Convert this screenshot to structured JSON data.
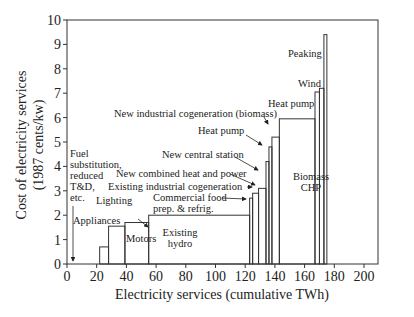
{
  "chart_data": {
    "type": "bar",
    "subtype": "supply-curve-step",
    "title": "",
    "xlabel": "Electricity services (cumulative TWh)",
    "ylabel": [
      "Cost of electricity services",
      "(1987 cents/kw)"
    ],
    "xlim": [
      0,
      210
    ],
    "ylim": [
      0,
      10
    ],
    "xticks": [
      0,
      20,
      40,
      60,
      80,
      100,
      120,
      140,
      160,
      180,
      200
    ],
    "yticks": [
      0,
      1,
      2,
      3,
      4,
      5,
      6,
      7,
      8,
      9,
      10
    ],
    "grid": false,
    "bars": [
      {
        "x0": 22,
        "x1": 28,
        "y": 0.7
      },
      {
        "x0": 28,
        "x1": 39,
        "y": 1.55
      },
      {
        "x0": 39,
        "x1": 55,
        "y": 1.7
      },
      {
        "x0": 55,
        "x1": 123,
        "y": 2.0
      },
      {
        "x0": 123,
        "x1": 125,
        "y": 2.7
      },
      {
        "x0": 125,
        "x1": 129,
        "y": 2.9
      },
      {
        "x0": 129,
        "x1": 134,
        "y": 3.1
      },
      {
        "x0": 134,
        "x1": 136,
        "y": 4.2
      },
      {
        "x0": 136,
        "x1": 138,
        "y": 4.8
      },
      {
        "x0": 138,
        "x1": 143,
        "y": 5.2
      },
      {
        "x0": 143,
        "x1": 167,
        "y": 5.95
      },
      {
        "x0": 167,
        "x1": 170,
        "y": 7.05
      },
      {
        "x0": 170,
        "x1": 173,
        "y": 7.2
      },
      {
        "x0": 173,
        "x1": 175,
        "y": 9.4
      }
    ],
    "annotations": [
      {
        "text": [
          "Fuel",
          "substitution,",
          "reduced",
          "T&D,",
          "etc."
        ],
        "x": 70,
        "y": 157
      },
      {
        "text": [
          "Appliances"
        ],
        "x": 73,
        "y": 224
      },
      {
        "text": [
          "Lighting"
        ],
        "x": 96,
        "y": 204
      },
      {
        "text": [
          "Motors"
        ],
        "x": 126,
        "y": 242
      },
      {
        "text": [
          "Existing",
          "hydro"
        ],
        "x": 180,
        "y": 236
      },
      {
        "text": [
          "Commercial food",
          "prep. & refrig."
        ],
        "x": 153,
        "y": 201
      },
      {
        "text": [
          "Existing industrial cogeneration"
        ],
        "x": 108,
        "y": 190
      },
      {
        "text": [
          "New combined heat and power"
        ],
        "x": 116,
        "y": 177
      },
      {
        "text": [
          "New central station"
        ],
        "x": 162,
        "y": 158
      },
      {
        "text": [
          "Heat pump"
        ],
        "x": 198,
        "y": 134
      },
      {
        "text": [
          "New industrial cogeneration (biomass)"
        ],
        "x": 114,
        "y": 117
      },
      {
        "text": [
          "Heat pump"
        ],
        "x": 268,
        "y": 107
      },
      {
        "text": [
          "Biomass",
          "CHP"
        ],
        "x": 311,
        "y": 180
      },
      {
        "text": [
          "Wind"
        ],
        "x": 298,
        "y": 87
      },
      {
        "text": [
          "Peaking"
        ],
        "x": 288,
        "y": 57
      }
    ]
  }
}
